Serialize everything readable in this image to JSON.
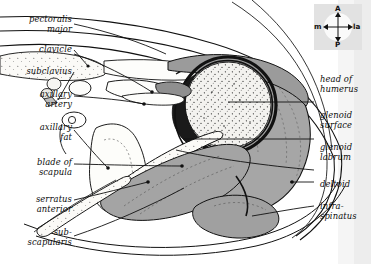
{
  "figure": {
    "kind": "anatomical-cross-section",
    "background": "#ffffff",
    "ink": "#111111",
    "fills": {
      "muscle_gray": "#a8a8a8",
      "muscle_gray_dark": "#949494",
      "bone_stipple": "#f2f1ee",
      "fat_stipple": "#fbfaf7",
      "edge_band": "#e9e9e9"
    }
  },
  "compass": {
    "name": "orientation-compass",
    "anterior": "A",
    "posterior": "P",
    "medial": "m",
    "lateral": "la",
    "box_fill": "#e2e2e2",
    "disc_fill": "#fafafa"
  },
  "labels_left": [
    {
      "id": "pectoralis-major",
      "line1": "pectoralis",
      "line2": "major",
      "x": 10,
      "y": 14,
      "w": 62
    },
    {
      "id": "clavicle",
      "line1": "clavicle",
      "line2": "",
      "x": 10,
      "y": 44,
      "w": 62
    },
    {
      "id": "subclavius",
      "line1": "subclavius",
      "line2": "",
      "x": 4,
      "y": 66,
      "w": 68
    },
    {
      "id": "axillary-artery",
      "line1": "axillary",
      "line2": "artery",
      "x": 10,
      "y": 89,
      "w": 62
    },
    {
      "id": "axillary-fat",
      "line1": "axillary",
      "line2": "fat",
      "x": 10,
      "y": 122,
      "w": 62
    },
    {
      "id": "blade-of-scapula",
      "line1": "blade of",
      "line2": "scapula",
      "x": 10,
      "y": 157,
      "w": 62
    },
    {
      "id": "serratus-anterior",
      "line1": "serratus",
      "line2": "anterior",
      "x": 6,
      "y": 194,
      "w": 66
    },
    {
      "id": "subscapularis",
      "line1": "sub-",
      "line2": "scapularis",
      "x": 2,
      "y": 227,
      "w": 70
    }
  ],
  "labels_right": [
    {
      "id": "head-of-humerus",
      "line1": "head of",
      "line2": "humerus",
      "x": 320,
      "y": 74
    },
    {
      "id": "glenoid-surface",
      "line1": "glenoid",
      "line2": "surface",
      "x": 320,
      "y": 110
    },
    {
      "id": "glenoid-labrum",
      "line1": "glenoid",
      "line2": "labrum",
      "x": 320,
      "y": 142
    },
    {
      "id": "deltoid",
      "line1": "deltoid",
      "line2": "",
      "x": 320,
      "y": 179
    },
    {
      "id": "infraspinatus",
      "line1": "infra-",
      "line2": "spinatus",
      "x": 320,
      "y": 201
    }
  ]
}
